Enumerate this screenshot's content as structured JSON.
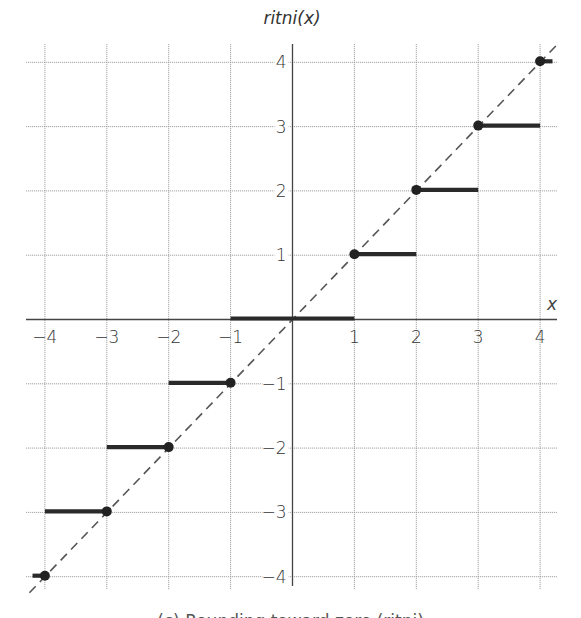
{
  "chart_data": {
    "type": "line",
    "title": "ritni(x)",
    "xlabel": "x",
    "ylabel": "ritni(x)",
    "xlim": [
      -4,
      4
    ],
    "ylim": [
      -4,
      4
    ],
    "grid": true,
    "x_ticks": [
      "−4",
      "−3",
      "−2",
      "−1",
      "1",
      "2",
      "3",
      "4"
    ],
    "y_ticks": [
      "4",
      "3",
      "2",
      "1",
      "−1",
      "−2",
      "−3",
      "−4"
    ],
    "reference_line": {
      "label": "y = x",
      "style": "dashed",
      "from": [
        -4.25,
        -4.25
      ],
      "to": [
        4.3,
        4.3
      ]
    },
    "series": [
      {
        "name": "ritni(x) (round toward zero)",
        "style": "step segments, closed dot at integer end, open at other end",
        "segments": [
          {
            "x_start": -4.2,
            "x_end": -4,
            "y": -4,
            "closed_at": -4
          },
          {
            "x_start": -4,
            "x_end": -3,
            "y": -3,
            "closed_at": -3
          },
          {
            "x_start": -3,
            "x_end": -2,
            "y": -2,
            "closed_at": -2
          },
          {
            "x_start": -2,
            "x_end": -1,
            "y": -1,
            "closed_at": -1
          },
          {
            "x_start": -1,
            "x_end": 1,
            "y": 0,
            "closed_at": null
          },
          {
            "x_start": 1,
            "x_end": 2,
            "y": 1,
            "closed_at": 1
          },
          {
            "x_start": 2,
            "x_end": 3,
            "y": 2,
            "closed_at": 2
          },
          {
            "x_start": 3,
            "x_end": 4,
            "y": 3,
            "closed_at": 3
          },
          {
            "x_start": 4,
            "x_end": 4.2,
            "y": 4,
            "closed_at": 4
          }
        ],
        "closed_points": [
          [
            -4,
            -4
          ],
          [
            -3,
            -3
          ],
          [
            -2,
            -2
          ],
          [
            -1,
            -1
          ],
          [
            1,
            1
          ],
          [
            2,
            2
          ],
          [
            3,
            3
          ],
          [
            4,
            4
          ]
        ]
      }
    ],
    "caption": "(c) Rounding toward zero (ritni)"
  },
  "labels": {
    "title": "ritni(x)",
    "x_var": "x",
    "caption": "(c) Rounding toward zero (ritni)"
  },
  "colors": {
    "segment": "#2a2a2a",
    "grid": "#9a9a9a",
    "axis": "#444444",
    "diagonal": "#555555"
  }
}
